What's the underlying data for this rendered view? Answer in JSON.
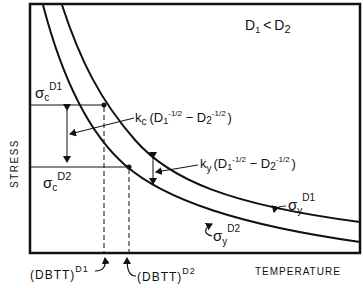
{
  "diagram": {
    "condition": "D₁ < D₂",
    "condition_parts": {
      "d1": "D",
      "d1_sub": "1",
      "lt": "<",
      "d2": "D",
      "d2_sub": "2"
    },
    "axes": {
      "xlabel": "TEMPERATURE",
      "ylabel": "STRESS"
    },
    "labels": {
      "sigma_c_d1": {
        "sym": "σ",
        "sub": "c",
        "sup": "D1"
      },
      "sigma_c_d2": {
        "sym": "σ",
        "sub": "c",
        "sup": "D2"
      },
      "sigma_y_d1": {
        "sym": "σ",
        "sub": "y",
        "sup": "D1"
      },
      "sigma_y_d2": {
        "sym": "σ",
        "sub": "y",
        "sup": "D2"
      },
      "kc_expr": {
        "k": "k",
        "sub": "c",
        "body1": "(D",
        "s1": "1",
        "e1": "-1/2",
        "mid": " − D",
        "s2": "2",
        "e2": "-1/2",
        "end": ")"
      },
      "ky_expr": {
        "k": "k",
        "sub": "y",
        "body1": "(D",
        "s1": "1",
        "e1": "-1/2",
        "mid": " − D",
        "s2": "2",
        "e2": "-1/2",
        "end": ")"
      },
      "dbtt_d1": {
        "text": "(DBTT)",
        "sup": "D1"
      },
      "dbtt_d2": {
        "text": "(DBTT)",
        "sup": "D2"
      }
    },
    "curves": [
      {
        "name": "sigma_y_D1",
        "description": "yield stress curve for grain size D1 (upper)"
      },
      {
        "name": "sigma_y_D2",
        "description": "yield stress curve for grain size D2 (lower)"
      }
    ],
    "colors": {
      "ink": "#111111",
      "background": "#ffffff"
    }
  }
}
